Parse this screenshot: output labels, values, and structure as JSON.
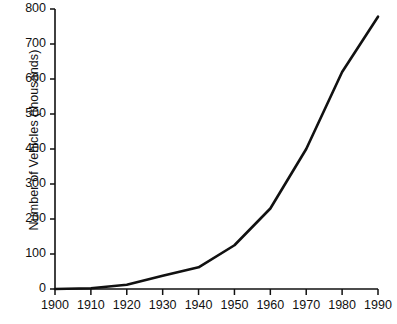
{
  "chart_data": {
    "type": "line",
    "title": "",
    "subtitle": "",
    "xlabel": "",
    "ylabel": "Number of Vehicles (thousands)",
    "x": [
      1900,
      1910,
      1920,
      1930,
      1940,
      1950,
      1960,
      1970,
      1980,
      1990
    ],
    "values": [
      0,
      2,
      12,
      38,
      62,
      125,
      230,
      400,
      620,
      778
    ],
    "series": [
      {
        "name": "Number of Vehicles (thousands)",
        "values": [
          0,
          2,
          12,
          38,
          62,
          125,
          230,
          400,
          620,
          778
        ]
      }
    ],
    "xlim": [
      1900,
      1990
    ],
    "ylim": [
      0,
      800
    ],
    "xticks": [
      1900,
      1910,
      1920,
      1930,
      1940,
      1950,
      1960,
      1970,
      1980,
      1990
    ],
    "yticks": [
      0,
      100,
      200,
      300,
      400,
      500,
      600,
      700,
      800
    ],
    "xtick_labels": [
      "1900",
      "1910",
      "1920",
      "1930",
      "1940",
      "1950",
      "1960",
      "1970",
      "1980",
      "1990"
    ],
    "ytick_labels": [
      "0",
      "100",
      "200",
      "300",
      "400",
      "500",
      "600",
      "700",
      "800"
    ],
    "grid": false,
    "legend": false,
    "legend_position": "none",
    "annotations": [],
    "line_color": "#111111",
    "axis_color": "#111111",
    "background_color": "#ffffff"
  }
}
